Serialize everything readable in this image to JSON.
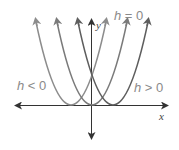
{
  "diagram": {
    "axes": {
      "x_label": "x",
      "y_label": "y"
    },
    "labels": {
      "h_zero": {
        "var": "h",
        "rel": "= 0"
      },
      "h_neg": {
        "var": "h",
        "rel": "< 0"
      },
      "h_pos": {
        "var": "h",
        "rel": "> 0"
      }
    },
    "curves": [
      {
        "name": "h<0",
        "vertex_px": [
          71,
          105
        ],
        "color": "#8c8c8c"
      },
      {
        "name": "h=0",
        "vertex_px": [
          92,
          105
        ],
        "color": "#7a7a7a"
      },
      {
        "name": "h>0",
        "vertex_px": [
          113,
          105
        ],
        "color": "#5e5e5e"
      }
    ]
  }
}
